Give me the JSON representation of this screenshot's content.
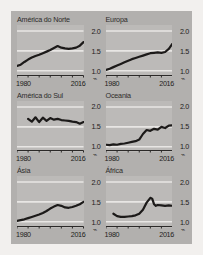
{
  "figure": {
    "background_color": "#b2b0ae",
    "panel_color": "#bcbab8",
    "gridline_color": "#e8e6e4",
    "line_color": "#1c1a19",
    "page_color": "#f2f0ee"
  },
  "chart_data": {
    "type": "line",
    "title": "",
    "subtitle": "",
    "xlabel": "",
    "ylabel": "",
    "grid": true,
    "legend": "none",
    "layout": "small-multiples 2 columns x 3 rows",
    "xlim": [
      1980,
      2016
    ],
    "ylim": [
      0.85,
      2.15
    ],
    "yticks": [
      1.0,
      1.5,
      2.0
    ],
    "ytick_labels": [
      "1.0",
      "1.5",
      "2.0"
    ],
    "y_axis_side": "right",
    "y_axis_break_symbol": "⌁",
    "xticks": [
      1980,
      1986,
      1992,
      1998,
      2004,
      2010,
      2016
    ],
    "xtick_labels_shown": [
      "1980",
      "2016"
    ],
    "panels": [
      {
        "title": "América do Norte",
        "x": [
          1980,
          1982,
          1984,
          1986,
          1988,
          1990,
          1992,
          1994,
          1996,
          1998,
          2000,
          2002,
          2004,
          2006,
          2008,
          2010,
          2012,
          2014,
          2016
        ],
        "y": [
          1.12,
          1.15,
          1.22,
          1.28,
          1.33,
          1.37,
          1.4,
          1.44,
          1.48,
          1.52,
          1.57,
          1.62,
          1.58,
          1.56,
          1.55,
          1.56,
          1.58,
          1.63,
          1.72
        ]
      },
      {
        "title": "Europa",
        "x": [
          1980,
          1982,
          1984,
          1986,
          1988,
          1990,
          1992,
          1994,
          1996,
          1998,
          2000,
          2002,
          2004,
          2006,
          2008,
          2010,
          2012,
          2014,
          2016
        ],
        "y": [
          1.02,
          1.05,
          1.09,
          1.13,
          1.17,
          1.21,
          1.25,
          1.29,
          1.32,
          1.35,
          1.38,
          1.41,
          1.44,
          1.45,
          1.46,
          1.45,
          1.47,
          1.55,
          1.68
        ]
      },
      {
        "title": "América do Sul",
        "x": [
          1986,
          1988,
          1990,
          1992,
          1994,
          1996,
          1998,
          2000,
          2002,
          2004,
          2006,
          2008,
          2010,
          2012,
          2014,
          2016
        ],
        "y": [
          1.7,
          1.63,
          1.74,
          1.62,
          1.73,
          1.65,
          1.72,
          1.68,
          1.7,
          1.67,
          1.66,
          1.65,
          1.63,
          1.62,
          1.58,
          1.62
        ]
      },
      {
        "title": "Oceania",
        "x": [
          1980,
          1982,
          1984,
          1986,
          1988,
          1990,
          1992,
          1994,
          1996,
          1998,
          2000,
          2002,
          2004,
          2006,
          2008,
          2010,
          2012,
          2014,
          2016
        ],
        "y": [
          1.05,
          1.04,
          1.06,
          1.05,
          1.07,
          1.08,
          1.1,
          1.12,
          1.14,
          1.18,
          1.32,
          1.42,
          1.4,
          1.45,
          1.43,
          1.5,
          1.47,
          1.53,
          1.54
        ]
      },
      {
        "title": "Ásia",
        "x": [
          1980,
          1982,
          1984,
          1986,
          1988,
          1990,
          1992,
          1994,
          1996,
          1998,
          2000,
          2002,
          2004,
          2006,
          2008,
          2010,
          2012,
          2014,
          2016
        ],
        "y": [
          1.02,
          1.04,
          1.06,
          1.09,
          1.12,
          1.15,
          1.18,
          1.22,
          1.27,
          1.33,
          1.38,
          1.42,
          1.4,
          1.36,
          1.35,
          1.37,
          1.4,
          1.44,
          1.5
        ]
      },
      {
        "title": "África",
        "x": [
          1984,
          1986,
          1988,
          1990,
          1992,
          1994,
          1996,
          1998,
          2000,
          2002,
          2004,
          2005,
          2006,
          2007,
          2008,
          2010,
          2012,
          2014,
          2016
        ],
        "y": [
          1.2,
          1.14,
          1.12,
          1.12,
          1.13,
          1.14,
          1.16,
          1.2,
          1.3,
          1.48,
          1.6,
          1.58,
          1.44,
          1.4,
          1.42,
          1.41,
          1.4,
          1.41,
          1.4
        ]
      }
    ]
  }
}
